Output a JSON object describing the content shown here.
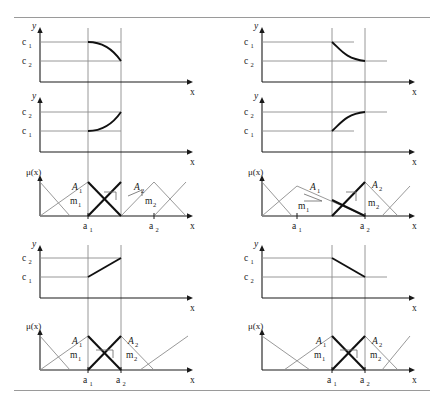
{
  "figure": {
    "type": "fuzzy-inference-interpolation-diagram",
    "panel_count": 4,
    "divider_color": "#9a9a9a",
    "curve_color": "#111111",
    "guide_color": "#8d8d8d"
  },
  "labels": {
    "y_axis": "y",
    "x_axis": "x",
    "mu_axis": "μ(x)",
    "c1": "c",
    "c1_sub": "1",
    "c2": "c",
    "c2_sub": "2",
    "A1": "A",
    "A1_sub": "1",
    "A2": "A",
    "A2_sub": "2",
    "m1": "m",
    "m1_sub": "1",
    "m2": "m",
    "m2_sub": "2",
    "a1": "a",
    "a1_sub": "1",
    "a2": "a",
    "a2_sub": "2"
  },
  "panels": [
    {
      "id": "top-left",
      "position": "top-left",
      "subplots": [
        {
          "kind": "output-curve",
          "y_ticks": [
            "c1",
            "c2"
          ],
          "top_tick": "c1",
          "bottom_tick": "c2",
          "shape": "flat-then-concave-decreasing",
          "description": "starts at c1, stays flat, then curves down to c2 at a2"
        },
        {
          "kind": "output-curve",
          "y_ticks": [
            "c2",
            "c1"
          ],
          "top_tick": "c2",
          "bottom_tick": "c1",
          "shape": "flat-then-convex-increasing",
          "description": "starts at c1, stays flat, then curves up to c2 at a2"
        },
        {
          "kind": "membership",
          "A1_width": "narrow",
          "A2_width": "narrow",
          "overlap": "wide-gap",
          "m1_slope": "steep",
          "m2_slope": "shallow"
        }
      ]
    },
    {
      "id": "top-right",
      "position": "top-right",
      "subplots": [
        {
          "kind": "output-curve",
          "y_ticks": [
            "c1",
            "c2"
          ],
          "top_tick": "c1",
          "bottom_tick": "c2",
          "shape": "convex-decreasing-then-flat",
          "description": "drops steeply from c1 then flattens at c2"
        },
        {
          "kind": "output-curve",
          "y_ticks": [
            "c2",
            "c1"
          ],
          "top_tick": "c2",
          "bottom_tick": "c1",
          "shape": "concave-increasing-then-flat",
          "description": "rises steeply from c1 then flattens at c2"
        },
        {
          "kind": "membership",
          "A1_width": "wide",
          "A2_width": "narrow",
          "overlap": "wide-gap",
          "m1_slope": "shallow",
          "m2_slope": "steep"
        }
      ]
    },
    {
      "id": "bottom-left",
      "position": "bottom-left",
      "subplots": [
        {
          "kind": "output-curve",
          "y_ticks": [
            "c2",
            "c1"
          ],
          "top_tick": "c2",
          "bottom_tick": "c1",
          "shape": "linear-increasing",
          "description": "straight line rising from c1 at a1 to c2 at a2"
        },
        {
          "kind": "membership",
          "A1_width": "narrow",
          "A2_width": "narrow",
          "overlap": "symmetric-crossing",
          "m1_slope": "equal",
          "m2_slope": "equal"
        }
      ]
    },
    {
      "id": "bottom-right",
      "position": "bottom-right",
      "subplots": [
        {
          "kind": "output-curve",
          "y_ticks": [
            "c1",
            "c2"
          ],
          "top_tick": "c1",
          "bottom_tick": "c2",
          "shape": "linear-decreasing",
          "description": "straight line falling from c1 at a1 to c2 at a2"
        },
        {
          "kind": "membership",
          "A1_width": "narrow",
          "A2_width": "narrow",
          "overlap": "symmetric-crossing",
          "m1_slope": "equal",
          "m2_slope": "equal"
        }
      ]
    }
  ]
}
